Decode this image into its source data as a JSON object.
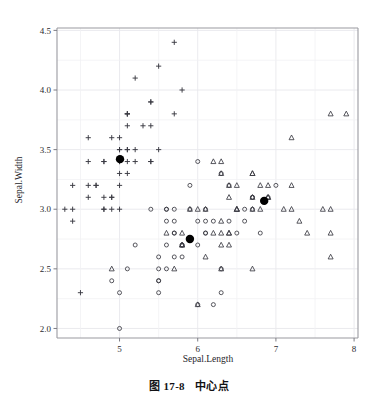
{
  "figure": {
    "caption_number": "图 17-8",
    "caption_text": "中心点"
  },
  "chart_data": {
    "type": "scatter",
    "title": "",
    "xlabel": "Sepal.Length",
    "ylabel": "Sepal.Width",
    "xlim": [
      4.2,
      8.05
    ],
    "ylim": [
      1.92,
      4.52
    ],
    "xticks": [
      5,
      6,
      7,
      8
    ],
    "xtick_labels": [
      "5",
      "6",
      "7",
      "8"
    ],
    "yticks": [
      2.0,
      2.5,
      3.0,
      3.5,
      4.0,
      4.5
    ],
    "ytick_labels": [
      "2.0",
      "2.5",
      "3.0",
      "3.5",
      "4.0",
      "4.5"
    ],
    "grid": true,
    "grid_color": "#e8e8ec",
    "legend": "none",
    "marker_color": "#3a3a42",
    "centroid_color": "#000000",
    "series": [
      {
        "name": "cluster-1-setosa",
        "marker": "plus",
        "points": [
          [
            5.1,
            3.5
          ],
          [
            4.9,
            3.0
          ],
          [
            4.7,
            3.2
          ],
          [
            4.6,
            3.1
          ],
          [
            5.0,
            3.6
          ],
          [
            5.4,
            3.9
          ],
          [
            4.6,
            3.4
          ],
          [
            5.0,
            3.4
          ],
          [
            4.4,
            2.9
          ],
          [
            4.9,
            3.1
          ],
          [
            5.4,
            3.7
          ],
          [
            4.8,
            3.4
          ],
          [
            4.8,
            3.0
          ],
          [
            4.3,
            3.0
          ],
          [
            5.8,
            4.0
          ],
          [
            5.7,
            4.4
          ],
          [
            5.4,
            3.9
          ],
          [
            5.1,
            3.5
          ],
          [
            5.7,
            3.8
          ],
          [
            5.1,
            3.8
          ],
          [
            5.4,
            3.4
          ],
          [
            5.1,
            3.7
          ],
          [
            4.6,
            3.6
          ],
          [
            5.1,
            3.3
          ],
          [
            4.8,
            3.4
          ],
          [
            5.0,
            3.0
          ],
          [
            5.0,
            3.4
          ],
          [
            5.2,
            3.5
          ],
          [
            5.2,
            3.4
          ],
          [
            4.7,
            3.2
          ],
          [
            4.8,
            3.1
          ],
          [
            5.4,
            3.4
          ],
          [
            5.2,
            4.1
          ],
          [
            5.5,
            4.2
          ],
          [
            4.9,
            3.1
          ],
          [
            5.0,
            3.2
          ],
          [
            5.5,
            3.5
          ],
          [
            4.9,
            3.6
          ],
          [
            4.4,
            3.0
          ],
          [
            5.1,
            3.4
          ],
          [
            5.0,
            3.5
          ],
          [
            4.5,
            2.3
          ],
          [
            4.4,
            3.2
          ],
          [
            5.0,
            3.5
          ],
          [
            5.1,
            3.8
          ],
          [
            4.8,
            3.0
          ],
          [
            5.1,
            3.8
          ],
          [
            4.6,
            3.2
          ],
          [
            5.3,
            3.7
          ],
          [
            5.0,
            3.3
          ]
        ]
      },
      {
        "name": "cluster-2-versicolor",
        "marker": "circle",
        "points": [
          [
            7.0,
            3.2
          ],
          [
            6.4,
            3.2
          ],
          [
            6.9,
            3.1
          ],
          [
            5.5,
            2.3
          ],
          [
            6.5,
            2.8
          ],
          [
            5.7,
            2.8
          ],
          [
            6.3,
            3.3
          ],
          [
            4.9,
            2.4
          ],
          [
            6.6,
            2.9
          ],
          [
            5.2,
            2.7
          ],
          [
            5.0,
            2.0
          ],
          [
            5.9,
            3.0
          ],
          [
            6.0,
            2.2
          ],
          [
            6.1,
            2.9
          ],
          [
            5.6,
            2.9
          ],
          [
            6.7,
            3.1
          ],
          [
            5.6,
            3.0
          ],
          [
            5.8,
            2.7
          ],
          [
            6.2,
            2.2
          ],
          [
            5.6,
            2.5
          ],
          [
            5.9,
            3.2
          ],
          [
            6.1,
            2.8
          ],
          [
            6.3,
            2.5
          ],
          [
            6.1,
            2.8
          ],
          [
            6.4,
            2.9
          ],
          [
            6.6,
            3.0
          ],
          [
            6.8,
            2.8
          ],
          [
            6.7,
            3.0
          ],
          [
            6.0,
            2.9
          ],
          [
            5.7,
            2.6
          ],
          [
            5.5,
            2.4
          ],
          [
            5.5,
            2.4
          ],
          [
            5.8,
            2.7
          ],
          [
            6.0,
            2.7
          ],
          [
            5.4,
            3.0
          ],
          [
            6.0,
            3.4
          ],
          [
            6.7,
            3.1
          ],
          [
            6.3,
            2.3
          ],
          [
            5.6,
            3.0
          ],
          [
            5.5,
            2.5
          ],
          [
            5.5,
            2.6
          ],
          [
            6.1,
            3.0
          ],
          [
            5.8,
            2.6
          ],
          [
            5.0,
            2.3
          ],
          [
            5.6,
            2.7
          ],
          [
            5.7,
            3.0
          ],
          [
            5.7,
            2.9
          ],
          [
            6.2,
            2.9
          ],
          [
            5.1,
            2.5
          ],
          [
            5.7,
            2.8
          ]
        ]
      },
      {
        "name": "cluster-3-virginica",
        "marker": "triangle",
        "points": [
          [
            6.3,
            3.3
          ],
          [
            5.8,
            2.7
          ],
          [
            7.1,
            3.0
          ],
          [
            6.3,
            2.9
          ],
          [
            6.5,
            3.0
          ],
          [
            7.6,
            3.0
          ],
          [
            4.9,
            2.5
          ],
          [
            7.3,
            2.9
          ],
          [
            6.7,
            2.5
          ],
          [
            7.2,
            3.6
          ],
          [
            6.5,
            3.2
          ],
          [
            6.4,
            2.7
          ],
          [
            6.8,
            3.0
          ],
          [
            5.7,
            2.5
          ],
          [
            5.8,
            2.8
          ],
          [
            6.4,
            3.2
          ],
          [
            6.5,
            3.0
          ],
          [
            7.7,
            3.8
          ],
          [
            7.7,
            2.6
          ],
          [
            6.0,
            2.2
          ],
          [
            6.9,
            3.2
          ],
          [
            5.6,
            2.8
          ],
          [
            7.7,
            2.8
          ],
          [
            6.3,
            2.7
          ],
          [
            6.7,
            3.3
          ],
          [
            7.2,
            3.2
          ],
          [
            6.2,
            2.8
          ],
          [
            6.1,
            3.0
          ],
          [
            6.4,
            2.8
          ],
          [
            7.2,
            3.0
          ],
          [
            7.4,
            2.8
          ],
          [
            7.9,
            3.8
          ],
          [
            6.4,
            2.8
          ],
          [
            6.3,
            2.8
          ],
          [
            6.1,
            2.6
          ],
          [
            7.7,
            3.0
          ],
          [
            6.3,
            3.4
          ],
          [
            6.4,
            3.1
          ],
          [
            6.0,
            3.0
          ],
          [
            6.9,
            3.1
          ],
          [
            6.7,
            3.1
          ],
          [
            6.9,
            3.1
          ],
          [
            5.8,
            2.7
          ],
          [
            6.8,
            3.2
          ],
          [
            6.7,
            3.3
          ],
          [
            6.7,
            3.0
          ],
          [
            6.3,
            2.5
          ],
          [
            6.5,
            3.0
          ],
          [
            6.2,
            3.4
          ],
          [
            5.9,
            3.0
          ]
        ]
      }
    ],
    "centroids": [
      {
        "name": "centroid-setosa",
        "x": 5.006,
        "y": 3.42
      },
      {
        "name": "centroid-versicolor",
        "x": 5.9,
        "y": 2.75
      },
      {
        "name": "centroid-virginica",
        "x": 6.85,
        "y": 3.07
      }
    ]
  }
}
